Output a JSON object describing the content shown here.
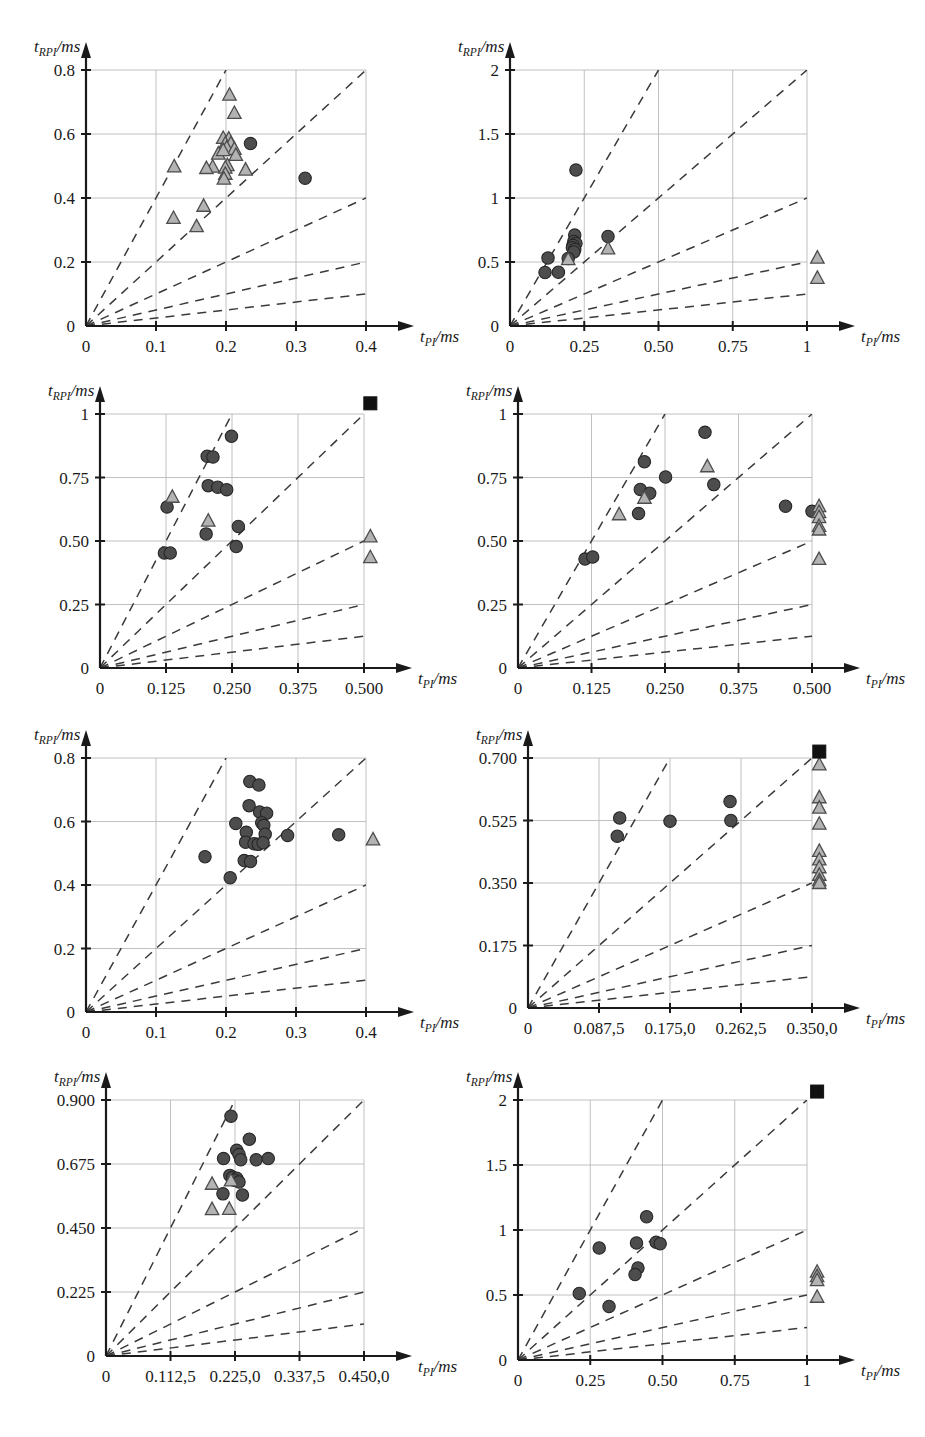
{
  "figure": {
    "title": "",
    "layout": "4 rows x 2 columns of scatter plots",
    "axis_label_y": "t_RPI/ms",
    "axis_label_x": "t_PI/ms",
    "marker_colors": {
      "circle_fill": "#4d4d4d",
      "circle_stroke": "#262626",
      "triangle_fill": "#b3b3b3",
      "triangle_stroke": "#4d4d4d",
      "square_fill": "#111111",
      "grid": "#b9b9b9",
      "axis": "#1a1a1a",
      "dashed": "#3a3a3a"
    },
    "reference_line_slopes": [
      4,
      2,
      1,
      0.5,
      0.25
    ]
  },
  "chart_data": [
    {
      "id": "p1",
      "type": "scatter",
      "title": "",
      "xlabel": "t_PI/ms",
      "ylabel": "t_RPI/ms",
      "xlim": [
        0,
        0.4
      ],
      "ylim": [
        0,
        0.8
      ],
      "xticks": [
        0,
        0.1,
        0.2,
        0.3,
        0.4
      ],
      "xticklabels": [
        "0",
        "0.1",
        "0.2",
        "0.3",
        "0.4"
      ],
      "yticks": [
        0,
        0.2,
        0.4,
        0.6,
        0.8
      ],
      "yticklabels": [
        "0",
        "0.2",
        "0.4",
        "0.6",
        "0.8"
      ],
      "grid": true,
      "series": [
        {
          "name": "circles",
          "marker": "circle",
          "points": [
            [
              0.235,
              0.57
            ],
            [
              0.313,
              0.462
            ]
          ]
        },
        {
          "name": "triangles",
          "marker": "triangle",
          "points": [
            [
              0.205,
              0.725
            ],
            [
              0.212,
              0.668
            ],
            [
              0.196,
              0.59
            ],
            [
              0.204,
              0.588
            ],
            [
              0.199,
              0.573
            ],
            [
              0.207,
              0.573
            ],
            [
              0.201,
              0.56
            ],
            [
              0.212,
              0.556
            ],
            [
              0.189,
              0.541
            ],
            [
              0.214,
              0.537
            ],
            [
              0.196,
              0.552
            ],
            [
              0.181,
              0.5
            ],
            [
              0.126,
              0.501
            ],
            [
              0.202,
              0.505
            ],
            [
              0.199,
              0.497
            ],
            [
              0.172,
              0.496
            ],
            [
              0.228,
              0.491
            ],
            [
              0.199,
              0.478
            ],
            [
              0.197,
              0.463
            ],
            [
              0.168,
              0.378
            ],
            [
              0.125,
              0.34
            ],
            [
              0.158,
              0.314
            ]
          ]
        }
      ],
      "squares": []
    },
    {
      "id": "p2",
      "type": "scatter",
      "title": "",
      "xlabel": "t_PI/ms",
      "ylabel": "t_RPI/ms",
      "xlim": [
        0,
        1.0
      ],
      "ylim": [
        0,
        2.0
      ],
      "xticks": [
        0,
        0.25,
        0.5,
        0.75,
        1.0
      ],
      "xticklabels": [
        "0",
        "0.25",
        "0.50",
        "0.75",
        "1"
      ],
      "yticks": [
        0,
        0.5,
        1.0,
        1.5,
        2.0
      ],
      "yticklabels": [
        "0",
        "0.5",
        "1",
        "1.5",
        "2"
      ],
      "grid": true,
      "series": [
        {
          "name": "circles",
          "marker": "circle",
          "points": [
            [
              0.222,
              1.218
            ],
            [
              0.218,
              0.71
            ],
            [
              0.33,
              0.7
            ],
            [
              0.215,
              0.66
            ],
            [
              0.222,
              0.645
            ],
            [
              0.212,
              0.63
            ],
            [
              0.21,
              0.612
            ],
            [
              0.218,
              0.598
            ],
            [
              0.215,
              0.578
            ],
            [
              0.128,
              0.532
            ],
            [
              0.196,
              0.528
            ],
            [
              0.118,
              0.418
            ],
            [
              0.163,
              0.42
            ]
          ]
        },
        {
          "name": "triangles",
          "marker": "triangle",
          "points": [
            [
              0.33,
              0.612
            ],
            [
              0.196,
              0.528
            ],
            [
              1.035,
              0.54
            ],
            [
              1.035,
              0.382
            ]
          ]
        }
      ],
      "squares": []
    },
    {
      "id": "p3",
      "type": "scatter",
      "title": "",
      "xlabel": "t_PI/ms",
      "ylabel": "t_RPI/ms",
      "xlim": [
        0,
        0.5
      ],
      "ylim": [
        0,
        1.0
      ],
      "xticks": [
        0,
        0.125,
        0.25,
        0.375,
        0.5
      ],
      "xticklabels": [
        "0",
        "0.125",
        "0.250",
        "0.375",
        "0.500"
      ],
      "yticks": [
        0,
        0.25,
        0.5,
        0.75,
        1.0
      ],
      "yticklabels": [
        "0",
        "0.25",
        "0.50",
        "0.75",
        "1"
      ],
      "grid": true,
      "series": [
        {
          "name": "circles",
          "marker": "circle",
          "points": [
            [
              0.249,
              0.912
            ],
            [
              0.203,
              0.834
            ],
            [
              0.214,
              0.831
            ],
            [
              0.205,
              0.718
            ],
            [
              0.223,
              0.712
            ],
            [
              0.24,
              0.702
            ],
            [
              0.127,
              0.634
            ],
            [
              0.201,
              0.528
            ],
            [
              0.262,
              0.557
            ],
            [
              0.258,
              0.478
            ],
            [
              0.122,
              0.453
            ],
            [
              0.133,
              0.453
            ]
          ]
        },
        {
          "name": "triangles",
          "marker": "triangle",
          "points": [
            [
              0.137,
              0.677
            ],
            [
              0.205,
              0.583
            ],
            [
              0.512,
              0.521
            ],
            [
              0.512,
              0.439
            ]
          ]
        }
      ],
      "squares": [
        [
          0.512,
          1.042
        ]
      ]
    },
    {
      "id": "p4",
      "type": "scatter",
      "title": "",
      "xlabel": "t_PI/ms",
      "ylabel": "t_RPI/ms",
      "xlim": [
        0,
        0.5
      ],
      "ylim": [
        0,
        1.0
      ],
      "xticks": [
        0,
        0.125,
        0.25,
        0.375,
        0.5
      ],
      "xticklabels": [
        "0",
        "0.125",
        "0.250",
        "0.375",
        "0.500"
      ],
      "yticks": [
        0,
        0.25,
        0.5,
        0.75,
        1.0
      ],
      "yticklabels": [
        "0",
        "0.25",
        "0.50",
        "0.75",
        "1"
      ],
      "grid": true,
      "series": [
        {
          "name": "circles",
          "marker": "circle",
          "points": [
            [
              0.318,
              0.928
            ],
            [
              0.215,
              0.812
            ],
            [
              0.251,
              0.752
            ],
            [
              0.333,
              0.722
            ],
            [
              0.208,
              0.703
            ],
            [
              0.224,
              0.688
            ],
            [
              0.205,
              0.608
            ],
            [
              0.455,
              0.637
            ],
            [
              0.5,
              0.617
            ],
            [
              0.114,
              0.429
            ],
            [
              0.127,
              0.437
            ]
          ]
        },
        {
          "name": "triangles",
          "marker": "triangle",
          "points": [
            [
              0.322,
              0.797
            ],
            [
              0.215,
              0.673
            ],
            [
              0.172,
              0.608
            ],
            [
              0.512,
              0.64
            ],
            [
              0.512,
              0.617
            ],
            [
              0.512,
              0.597
            ],
            [
              0.512,
              0.562
            ],
            [
              0.512,
              0.548
            ],
            [
              0.512,
              0.432
            ]
          ]
        }
      ],
      "squares": []
    },
    {
      "id": "p5",
      "type": "scatter",
      "title": "",
      "xlabel": "t_PI/ms",
      "ylabel": "t_RPI/ms",
      "xlim": [
        0,
        0.4
      ],
      "ylim": [
        0,
        0.8
      ],
      "xticks": [
        0,
        0.1,
        0.2,
        0.3,
        0.4
      ],
      "xticklabels": [
        "0",
        "0.1",
        "0.2",
        "0.3",
        "0.4"
      ],
      "yticks": [
        0,
        0.2,
        0.4,
        0.6,
        0.8
      ],
      "yticklabels": [
        "0",
        "0.2",
        "0.4",
        "0.6",
        "0.8"
      ],
      "grid": true,
      "series": [
        {
          "name": "circles",
          "marker": "circle",
          "points": [
            [
              0.234,
              0.726
            ],
            [
              0.247,
              0.715
            ],
            [
              0.233,
              0.65
            ],
            [
              0.248,
              0.63
            ],
            [
              0.258,
              0.626
            ],
            [
              0.214,
              0.594
            ],
            [
              0.251,
              0.596
            ],
            [
              0.254,
              0.588
            ],
            [
              0.229,
              0.566
            ],
            [
              0.256,
              0.56
            ],
            [
              0.288,
              0.556
            ],
            [
              0.361,
              0.558
            ],
            [
              0.228,
              0.535
            ],
            [
              0.24,
              0.53
            ],
            [
              0.246,
              0.528
            ],
            [
              0.253,
              0.533
            ],
            [
              0.17,
              0.489
            ],
            [
              0.226,
              0.477
            ],
            [
              0.235,
              0.474
            ],
            [
              0.206,
              0.423
            ]
          ]
        },
        {
          "name": "triangles",
          "marker": "triangle",
          "points": [
            [
              0.41,
              0.546
            ]
          ]
        }
      ],
      "squares": []
    },
    {
      "id": "p6",
      "type": "scatter",
      "title": "",
      "xlabel": "t_PI/ms",
      "ylabel": "t_RPI/ms",
      "xlim": [
        0,
        0.35
      ],
      "ylim": [
        0,
        0.7
      ],
      "xticks": [
        0,
        0.0875,
        0.175,
        0.2625,
        0.35
      ],
      "xticklabels": [
        "0",
        "0.087,5",
        "0.175,0",
        "0.262,5",
        "0.350,0"
      ],
      "yticks": [
        0,
        0.175,
        0.35,
        0.525,
        0.7
      ],
      "yticklabels": [
        "0",
        "0.175",
        "0.350",
        "0.525",
        "0.700"
      ],
      "grid": true,
      "series": [
        {
          "name": "circles",
          "marker": "circle",
          "points": [
            [
              0.113,
              0.532
            ],
            [
              0.11,
              0.481
            ],
            [
              0.175,
              0.523
            ],
            [
              0.25,
              0.525
            ],
            [
              0.249,
              0.578
            ]
          ]
        },
        {
          "name": "triangles",
          "marker": "triangle",
          "points": [
            [
              0.359,
              0.684
            ],
            [
              0.359,
              0.592
            ],
            [
              0.359,
              0.563
            ],
            [
              0.359,
              0.518
            ],
            [
              0.359,
              0.442
            ],
            [
              0.359,
              0.418
            ],
            [
              0.359,
              0.396
            ],
            [
              0.359,
              0.375
            ],
            [
              0.359,
              0.36
            ],
            [
              0.359,
              0.352
            ]
          ]
        }
      ],
      "squares": [
        [
          0.359,
          0.718
        ]
      ]
    },
    {
      "id": "p7",
      "type": "scatter",
      "title": "",
      "xlabel": "t_PI/ms",
      "ylabel": "t_RPI/ms",
      "xlim": [
        0,
        0.45
      ],
      "ylim": [
        0,
        0.9
      ],
      "xticks": [
        0,
        0.1125,
        0.225,
        0.3375,
        0.45
      ],
      "xticklabels": [
        "0",
        "0.112,5",
        "0.225,0",
        "0.337,5",
        "0.450,0"
      ],
      "yticks": [
        0,
        0.225,
        0.45,
        0.675,
        0.9
      ],
      "yticklabels": [
        "0",
        "0.225",
        "0.450",
        "0.675",
        "0.900"
      ],
      "grid": true,
      "series": [
        {
          "name": "circles",
          "marker": "circle",
          "points": [
            [
              0.218,
              0.843
            ],
            [
              0.25,
              0.762
            ],
            [
              0.228,
              0.723
            ],
            [
              0.232,
              0.708
            ],
            [
              0.235,
              0.69
            ],
            [
              0.205,
              0.694
            ],
            [
              0.262,
              0.69
            ],
            [
              0.283,
              0.694
            ],
            [
              0.216,
              0.635
            ],
            [
              0.221,
              0.628
            ],
            [
              0.228,
              0.625
            ],
            [
              0.224,
              0.618
            ],
            [
              0.232,
              0.612
            ],
            [
              0.204,
              0.57
            ],
            [
              0.238,
              0.566
            ]
          ]
        },
        {
          "name": "triangles",
          "marker": "triangle",
          "points": [
            [
              0.185,
              0.608
            ],
            [
              0.218,
              0.62
            ],
            [
              0.185,
              0.519
            ],
            [
              0.215,
              0.52
            ]
          ]
        }
      ],
      "squares": []
    },
    {
      "id": "p8",
      "type": "scatter",
      "title": "",
      "xlabel": "t_PI/ms",
      "ylabel": "t_RPI/ms",
      "xlim": [
        0,
        1.0
      ],
      "ylim": [
        0,
        2.0
      ],
      "xticks": [
        0,
        0.25,
        0.5,
        0.75,
        1.0
      ],
      "xticklabels": [
        "0",
        "0.25",
        "0.50",
        "0.75",
        "1"
      ],
      "yticks": [
        0,
        0.5,
        1.0,
        1.5,
        2.0
      ],
      "yticklabels": [
        "0",
        "0.5",
        "1",
        "1.5",
        "2"
      ],
      "grid": true,
      "series": [
        {
          "name": "circles",
          "marker": "circle",
          "points": [
            [
              0.445,
              1.102
            ],
            [
              0.41,
              0.9
            ],
            [
              0.478,
              0.905
            ],
            [
              0.492,
              0.895
            ],
            [
              0.281,
              0.862
            ],
            [
              0.415,
              0.708
            ],
            [
              0.405,
              0.657
            ],
            [
              0.212,
              0.512
            ],
            [
              0.315,
              0.412
            ]
          ]
        },
        {
          "name": "triangles",
          "marker": "triangle",
          "points": [
            [
              1.035,
              0.685
            ],
            [
              1.035,
              0.65
            ],
            [
              1.035,
              0.62
            ],
            [
              1.035,
              0.492
            ]
          ]
        }
      ],
      "squares": [
        [
          1.035,
          2.065
        ]
      ]
    }
  ]
}
